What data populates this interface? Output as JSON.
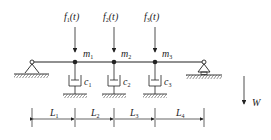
{
  "diagram": {
    "forces": [
      {
        "label": "f",
        "sub": "1",
        "arg": "(t)",
        "x": 75
      },
      {
        "label": "f",
        "sub": "2",
        "arg": "(t)",
        "x": 114
      },
      {
        "label": "f",
        "sub": "3",
        "arg": "(t)",
        "x": 155
      }
    ],
    "masses": [
      {
        "label": "m",
        "sub": "1"
      },
      {
        "label": "m",
        "sub": "2"
      },
      {
        "label": "m",
        "sub": "3"
      }
    ],
    "dampers": [
      {
        "label": "c",
        "sub": "1"
      },
      {
        "label": "c",
        "sub": "2"
      },
      {
        "label": "c",
        "sub": "3"
      }
    ],
    "spans": [
      {
        "label": "L",
        "sub": "1"
      },
      {
        "label": "L",
        "sub": "2"
      },
      {
        "label": "L",
        "sub": "3"
      },
      {
        "label": "L",
        "sub": "4"
      }
    ],
    "gravity": {
      "label": "W"
    },
    "colors": {
      "line": "#222222"
    }
  }
}
